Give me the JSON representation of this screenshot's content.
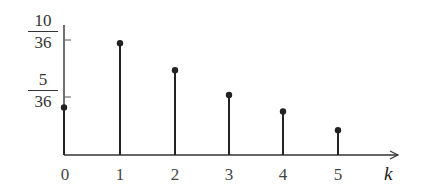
{
  "chart_data": {
    "type": "stem",
    "title": "",
    "xlabel": "k",
    "ylabel": "",
    "categories": [
      "0",
      "1",
      "2",
      "3",
      "4",
      "5"
    ],
    "x": [
      0,
      1,
      2,
      3,
      4,
      5
    ],
    "values": [
      0.115,
      0.27,
      0.205,
      0.145,
      0.105,
      0.06
    ],
    "values_in_36ths_estimated": [
      4.1,
      9.6,
      7.3,
      5.3,
      3.8,
      2.2
    ],
    "yticks": [
      {
        "value": 0.1389,
        "label_num": "5",
        "label_den": "36"
      },
      {
        "value": 0.2778,
        "label_num": "10",
        "label_den": "36"
      }
    ],
    "xticks": [
      "0",
      "1",
      "2",
      "3",
      "4",
      "5"
    ],
    "ylim": [
      0,
      0.33
    ],
    "grid": false,
    "legend": null,
    "colors": {
      "stem": "#222222",
      "axis": "#333333"
    }
  }
}
